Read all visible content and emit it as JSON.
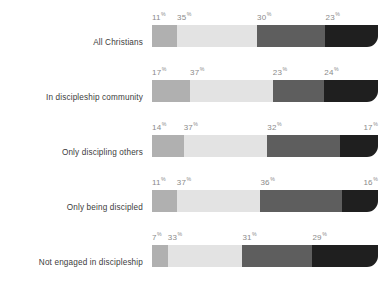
{
  "chart_data": {
    "type": "bar",
    "subtype": "stacked-horizontal-100",
    "title": "",
    "xlabel": "",
    "ylabel": "",
    "grid": false,
    "legend": false,
    "value_suffix": "%",
    "categories": [
      "All Christians",
      "In discipleship community",
      "Only discipling others",
      "Only being discipled",
      "Not engaged in discipleship"
    ],
    "series": [
      {
        "name": "segment-1",
        "color": "#b0b0b0",
        "values": [
          11,
          17,
          14,
          11,
          7
        ]
      },
      {
        "name": "segment-2",
        "color": "#e3e3e3",
        "values": [
          35,
          37,
          37,
          37,
          33
        ]
      },
      {
        "name": "segment-3",
        "color": "#5e5e5e",
        "values": [
          30,
          23,
          32,
          36,
          31
        ]
      },
      {
        "name": "segment-4",
        "color": "#1f1f1f",
        "values": [
          23,
          24,
          17,
          16,
          29
        ]
      }
    ],
    "rows": [
      {
        "label": "All Christians",
        "segments": [
          {
            "value": 11,
            "text": "11",
            "suffix": "%",
            "color": "#b0b0b0",
            "align": "left"
          },
          {
            "value": 35,
            "text": "35",
            "suffix": "%",
            "color": "#e3e3e3",
            "align": "left"
          },
          {
            "value": 30,
            "text": "30",
            "suffix": "%",
            "color": "#5e5e5e",
            "align": "left"
          },
          {
            "value": 23,
            "text": "23",
            "suffix": "%",
            "color": "#1f1f1f",
            "align": "left"
          }
        ]
      },
      {
        "label": "In discipleship community",
        "segments": [
          {
            "value": 17,
            "text": "17",
            "suffix": "%",
            "color": "#b0b0b0",
            "align": "left"
          },
          {
            "value": 37,
            "text": "37",
            "suffix": "%",
            "color": "#e3e3e3",
            "align": "left"
          },
          {
            "value": 23,
            "text": "23",
            "suffix": "%",
            "color": "#5e5e5e",
            "align": "left"
          },
          {
            "value": 24,
            "text": "24",
            "suffix": "%",
            "color": "#1f1f1f",
            "align": "left"
          }
        ]
      },
      {
        "label": "Only discipling others",
        "segments": [
          {
            "value": 14,
            "text": "14",
            "suffix": "%",
            "color": "#b0b0b0",
            "align": "left"
          },
          {
            "value": 37,
            "text": "37",
            "suffix": "%",
            "color": "#e3e3e3",
            "align": "left"
          },
          {
            "value": 32,
            "text": "32",
            "suffix": "%",
            "color": "#5e5e5e",
            "align": "left"
          },
          {
            "value": 17,
            "text": "17",
            "suffix": "%",
            "color": "#1f1f1f",
            "align": "right"
          }
        ]
      },
      {
        "label": "Only being discipled",
        "segments": [
          {
            "value": 11,
            "text": "11",
            "suffix": "%",
            "color": "#b0b0b0",
            "align": "left"
          },
          {
            "value": 37,
            "text": "37",
            "suffix": "%",
            "color": "#e3e3e3",
            "align": "left"
          },
          {
            "value": 36,
            "text": "36",
            "suffix": "%",
            "color": "#5e5e5e",
            "align": "left"
          },
          {
            "value": 16,
            "text": "16",
            "suffix": "%",
            "color": "#1f1f1f",
            "align": "right"
          }
        ]
      },
      {
        "label": "Not engaged in discipleship",
        "segments": [
          {
            "value": 7,
            "text": "7",
            "suffix": "%",
            "color": "#b0b0b0",
            "align": "left"
          },
          {
            "value": 33,
            "text": "33",
            "suffix": "%",
            "color": "#e3e3e3",
            "align": "left"
          },
          {
            "value": 31,
            "text": "31",
            "suffix": "%",
            "color": "#5e5e5e",
            "align": "left"
          },
          {
            "value": 29,
            "text": "29",
            "suffix": "%",
            "color": "#1f1f1f",
            "align": "left"
          }
        ]
      }
    ],
    "colors": {
      "segment_1": "#b0b0b0",
      "segment_2": "#e3e3e3",
      "segment_3": "#5e5e5e",
      "segment_4": "#1f1f1f",
      "label_text": "#3c3c3c",
      "value_text": "#8a8a8a",
      "background": "#ffffff"
    }
  }
}
